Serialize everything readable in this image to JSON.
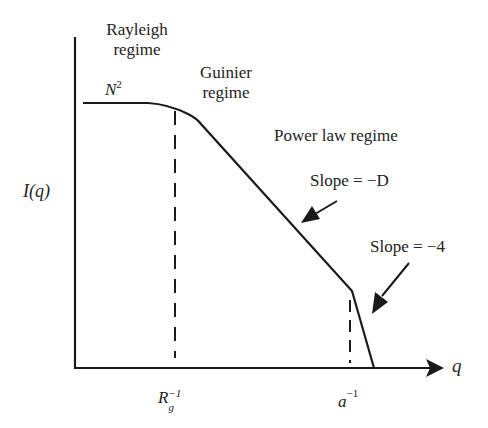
{
  "diagram": {
    "y_axis_label": "I(q)",
    "x_axis_label": "q",
    "regimes": [
      {
        "name": "Rayleigh",
        "line1": "Rayleigh",
        "line2": "regime"
      },
      {
        "name": "Guinier",
        "line1": "Guinier",
        "line2": "regime"
      },
      {
        "name": "Power law",
        "line1": "Power law regime"
      }
    ],
    "plateau_label": {
      "base": "N",
      "sup": "2"
    },
    "annotations": [
      {
        "text": "Slope = −D"
      },
      {
        "text": "Slope = −4"
      }
    ],
    "x_ticks": [
      {
        "base": "R",
        "sub": "g",
        "sup": "−1"
      },
      {
        "base": "a",
        "sup": "−1"
      }
    ],
    "colors": {
      "line": "#1a1a1a",
      "background": "#ffffff"
    }
  }
}
